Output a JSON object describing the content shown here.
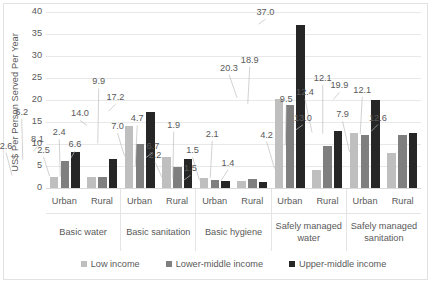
{
  "chart_data": {
    "type": "bar",
    "title": "",
    "subtitle": "",
    "xlabel": "",
    "ylabel": "US$ Per Person Served Per Year",
    "ylim": [
      0,
      40
    ],
    "yticks": [
      0,
      5,
      10,
      15,
      20,
      25,
      30,
      35,
      40
    ],
    "grid": true,
    "legend_position": "bottom",
    "categories": [
      "Basic water / Urban",
      "Basic water / Rural",
      "Basic sanitation / Urban",
      "Basic sanitation / Rural",
      "Basic hygiene / Urban",
      "Basic hygiene / Rural",
      "Safely managed water / Urban",
      "Safely managed water / Rural",
      "Safely managed sanitation / Urban",
      "Safely managed sanitation / Rural"
    ],
    "category_groups": [
      {
        "label": "Basic water",
        "subcategories": [
          "Urban",
          "Rural"
        ]
      },
      {
        "label": "Basic sanitation",
        "subcategories": [
          "Urban",
          "Rural"
        ]
      },
      {
        "label": "Basic hygiene",
        "subcategories": [
          "Urban",
          "Rural"
        ]
      },
      {
        "label": "Safely managed water",
        "subcategories": [
          "Urban",
          "Rural"
        ]
      },
      {
        "label": "Safely managed sanitation",
        "subcategories": [
          "Urban",
          "Rural"
        ]
      }
    ],
    "series": [
      {
        "name": "Low income",
        "color": "#bfbfbf",
        "values": [
          2.6,
          2.5,
          14.0,
          7.0,
          2.2,
          1.5,
          20.3,
          4.2,
          12.4,
          7.9
        ],
        "labels": [
          "2.6",
          "2.5",
          "14.0",
          "7.0",
          "2.2",
          "1.5",
          "20.3",
          "4.2",
          "12.4",
          "7.9"
        ]
      },
      {
        "name": "Lower-middle income",
        "color": "#7f7f7f",
        "values": [
          6.2,
          2.4,
          9.9,
          4.7,
          1.9,
          2.1,
          18.9,
          9.5,
          12.1,
          12.1
        ],
        "labels": [
          "6.2",
          "2.4",
          "9.9",
          "4.7",
          "1.9",
          "2.1",
          "18.9",
          "9.5",
          "12.1",
          "12.1"
        ]
      },
      {
        "name": "Upper-middle income",
        "color": "#262626",
        "values": [
          8.1,
          6.6,
          17.2,
          6.7,
          1.5,
          1.4,
          37.0,
          13.0,
          19.9,
          12.6
        ],
        "labels": [
          "8.1",
          "6.6",
          "17.2",
          "6.7",
          "1.5",
          "1.4",
          "37.0",
          "13.0",
          "19.9",
          "12.6"
        ]
      }
    ]
  },
  "legend": {
    "items": [
      {
        "label": "Low income",
        "color": "#bfbfbf"
      },
      {
        "label": "Lower-middle income",
        "color": "#7f7f7f"
      },
      {
        "label": "Upper-middle income",
        "color": "#262626"
      }
    ]
  },
  "axis": {
    "y_title": "US$ Per Person Served Per Year",
    "y_ticks": [
      "40",
      "35",
      "30",
      "25",
      "20",
      "15",
      "10",
      "5",
      "0"
    ]
  }
}
